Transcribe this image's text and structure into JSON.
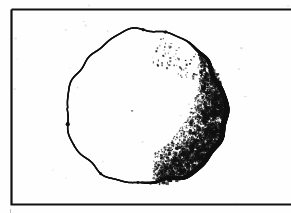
{
  "figure": {
    "domain": "Natural-Image",
    "kind": "scanned-line-drawing",
    "alt_text": "A roughly drawn circle with a heavy dark right edge and speckled shading along the lower right inside a thin black rectangle frame.",
    "background_color": "#fefefe",
    "ink_color": "#101010",
    "frame_color": "#111111",
    "canvas": {
      "width": 291,
      "height": 213
    }
  },
  "frame": {
    "name": "border-rectangle",
    "left": 11.5,
    "top": 9.5,
    "right": 291,
    "bottom": 204.5,
    "stroke_width": 2.2,
    "color": "#111111",
    "cropped_edge": "right",
    "note": "Right edge of the border runs off the image crop."
  },
  "sphere": {
    "name": "sphere-outline",
    "center_x": 146,
    "center_y": 108,
    "radius_x": 79,
    "radius_y": 77,
    "bounds": {
      "left": 67,
      "top": 31,
      "right": 226,
      "bottom": 186
    },
    "stroke_color": "#101010",
    "stroke_min_width": 1.5,
    "stroke_max_width": 5.2,
    "thick_arc_start_deg": -60,
    "thick_arc_end_deg": 95,
    "wobble_amplitude": 2.2,
    "note": "Hand-drawn irregular outline; thin on the upper-left, heavy on the right limb."
  },
  "shading": {
    "name": "stipple-crescent",
    "style": "stipple",
    "region": "lower-right limb",
    "inner_terminator_center_x": 92,
    "inner_terminator_center_y": 66,
    "inner_terminator_radius": 108,
    "angle_start_deg": -70,
    "angle_end_deg": 82,
    "dot_count": 4200,
    "dot_min_size": 0.5,
    "dot_max_size": 2.6,
    "density_peak_deg": 35,
    "color": "#111111",
    "note": "Dense speckled halftone fading toward the interior and toward the top of the limb."
  },
  "speckles": {
    "name": "scan-noise",
    "count": 26,
    "color": "#cfcfcf",
    "note": "Faint photocopy grain scattered over the white background."
  }
}
